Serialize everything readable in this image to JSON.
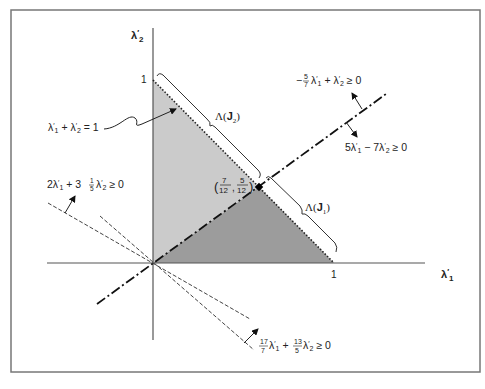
{
  "diagram": {
    "axes": {
      "x_label": "λ′₁",
      "y_label": "λ′₂",
      "x_tick": "1",
      "y_tick": "1"
    },
    "labels": {
      "simplex_line": "λ′₁ + λ′₂ = 1",
      "lambda_j2": "Λ(J₂)",
      "lambda_j1": "Λ(J₁)",
      "intersection_point": "(7/12, 5/12)",
      "ineq_upper": "−5/7 λ′₁ + λ′₂ ≥ 0",
      "ineq_lower": "5λ′₁ − 7λ′₂ ≥ 0",
      "ineq_left": "2λ′₁ + 3 1/5 λ′₂ ≥ 0",
      "ineq_bottom": "17/7 λ′₁ + 13/5 λ′₂ ≥ 0"
    },
    "regions": [
      {
        "name": "Λ(J₂)",
        "vertices": [
          [
            0,
            0
          ],
          [
            0,
            1
          ],
          [
            0.5833,
            0.4167
          ]
        ],
        "fill": "#c8c8c8"
      },
      {
        "name": "Λ(J₁)",
        "vertices": [
          [
            0,
            0
          ],
          [
            0.5833,
            0.4167
          ],
          [
            1,
            0
          ]
        ],
        "fill": "#9a9a9a"
      }
    ],
    "lines": [
      {
        "equation": "λ′₁ + λ′₂ = 1",
        "style": "dotted"
      },
      {
        "equation": "5λ′₁ − 7λ′₂ = 0",
        "style": "dash-dot"
      },
      {
        "equation": "2λ′₁ + 3.2λ′₂ = 0",
        "style": "dashed"
      },
      {
        "equation": "17/7 λ′₁ + 13/5 λ′₂ = 0",
        "style": "dashed"
      }
    ],
    "point": {
      "x": "7/12",
      "y": "5/12"
    }
  }
}
